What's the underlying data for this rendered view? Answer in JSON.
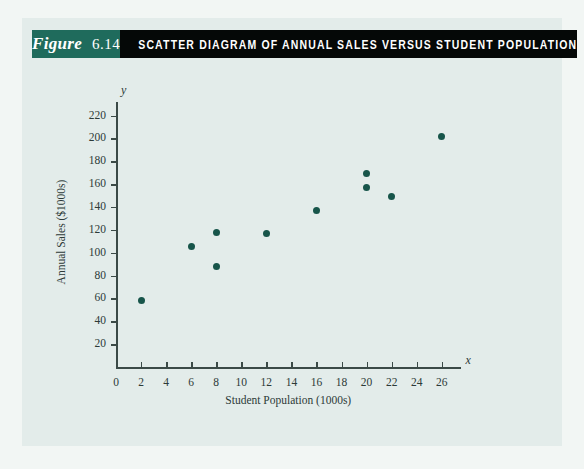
{
  "figure": {
    "label_word": "Figure",
    "number": "6.14",
    "title": "SCATTER DIAGRAM OF ANNUAL SALES VERSUS STUDENT POPULATION",
    "tag_bg": "#1f6b5c",
    "title_bg": "#050807",
    "panel_bg": "#e3ecea",
    "point_color": "#17554a"
  },
  "chart_data": {
    "type": "scatter",
    "title": "SCATTER DIAGRAM OF ANNUAL SALES VERSUS STUDENT POPULATION",
    "xlabel": "Student Population (1000s)",
    "ylabel": "Annual Sales ($1000s)",
    "x_axis_name": "x",
    "y_axis_name": "y",
    "xlim": [
      0,
      27.5
    ],
    "ylim": [
      0,
      232
    ],
    "xticks": [
      0,
      2,
      4,
      6,
      8,
      10,
      12,
      14,
      16,
      18,
      20,
      22,
      24,
      26
    ],
    "yticks": [
      20,
      40,
      60,
      80,
      100,
      120,
      140,
      160,
      180,
      200,
      220
    ],
    "grid": false,
    "legend": null,
    "series": [
      {
        "name": "Armand's Pizza Parlors",
        "x": [
          2,
          6,
          8,
          8,
          12,
          16,
          20,
          20,
          22,
          26
        ],
        "y": [
          58,
          105,
          88,
          118,
          117,
          137,
          157,
          169,
          149,
          202
        ]
      }
    ],
    "points": [
      {
        "x": 2,
        "y": 58
      },
      {
        "x": 6,
        "y": 105
      },
      {
        "x": 8,
        "y": 88
      },
      {
        "x": 8,
        "y": 118
      },
      {
        "x": 12,
        "y": 117
      },
      {
        "x": 16,
        "y": 137
      },
      {
        "x": 20,
        "y": 157
      },
      {
        "x": 20,
        "y": 169
      },
      {
        "x": 22,
        "y": 149
      },
      {
        "x": 26,
        "y": 202
      }
    ]
  }
}
